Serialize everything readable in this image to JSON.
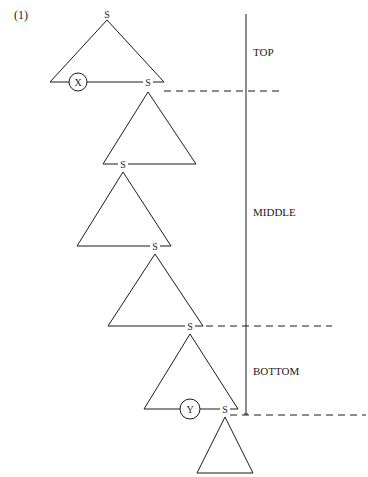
{
  "figure": {
    "number_label": "(1)"
  },
  "nodes": {
    "root": "S",
    "t1_base_s": "S",
    "t2_base_s": "S",
    "t3_base_s": "S",
    "t4_base_s": "S",
    "t5_base_s": "S",
    "x_marker": "X",
    "y_marker": "Y"
  },
  "regions": [
    {
      "label": "TOP"
    },
    {
      "label": "MIDDLE"
    },
    {
      "label": "BOTTOM"
    }
  ]
}
